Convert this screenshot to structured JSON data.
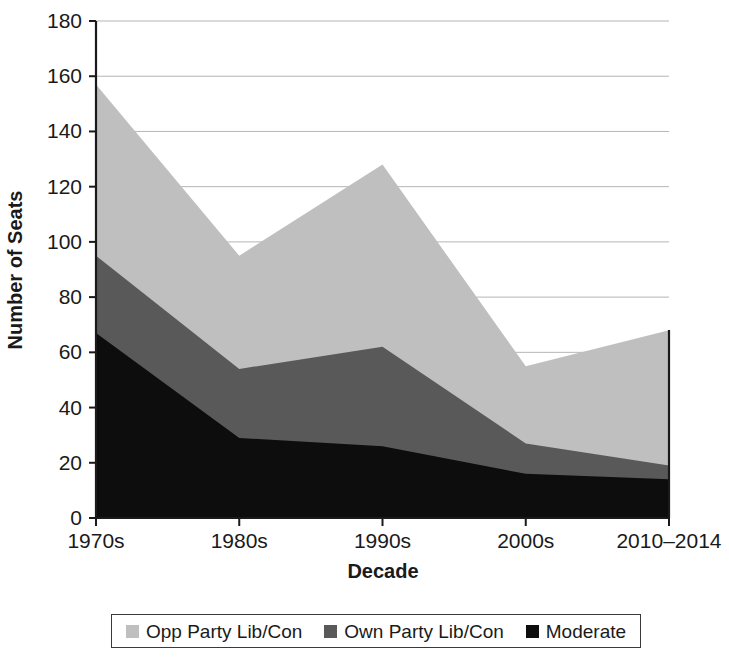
{
  "chart_data": {
    "type": "area",
    "stacked": true,
    "title": "",
    "xlabel": "Decade",
    "ylabel": "Number of Seats",
    "categories": [
      "1970s",
      "1980s",
      "1990s",
      "2000s",
      "2010–2014"
    ],
    "ylim": [
      0,
      180
    ],
    "yticks": [
      0,
      20,
      40,
      60,
      80,
      100,
      120,
      140,
      160,
      180
    ],
    "ytick_labels": [
      "0",
      "20",
      "40",
      "60",
      "80",
      "100",
      "120",
      "140",
      "160",
      "180"
    ],
    "grid": true,
    "grid_axis": "y",
    "legend_position": "bottom",
    "stack_order_bottom_to_top": [
      "Moderate",
      "Own Party Lib/Con",
      "Opp Party Lib/Con"
    ],
    "series": [
      {
        "name": "Opp Party Lib/Con",
        "color": "#bfbfbf",
        "values": [
          62,
          41,
          66,
          28,
          49
        ],
        "cumulative_top": [
          157,
          95,
          128,
          55,
          68
        ]
      },
      {
        "name": "Own Party Lib/Con",
        "color": "#595959",
        "values": [
          28,
          25,
          36,
          11,
          5
        ],
        "cumulative_top": [
          95,
          54,
          62,
          27,
          19
        ]
      },
      {
        "name": "Moderate",
        "color": "#0d0d0d",
        "values": [
          67,
          29,
          26,
          16,
          14
        ],
        "cumulative_top": [
          67,
          29,
          26,
          16,
          14
        ]
      }
    ]
  },
  "legend": {
    "items": [
      {
        "label": "Opp Party Lib/Con",
        "color": "#bfbfbf"
      },
      {
        "label": "Own Party Lib/Con",
        "color": "#595959"
      },
      {
        "label": "Moderate",
        "color": "#0d0d0d"
      }
    ]
  },
  "axes": {
    "y_title": "Number of Seats",
    "x_title": "Decade"
  }
}
